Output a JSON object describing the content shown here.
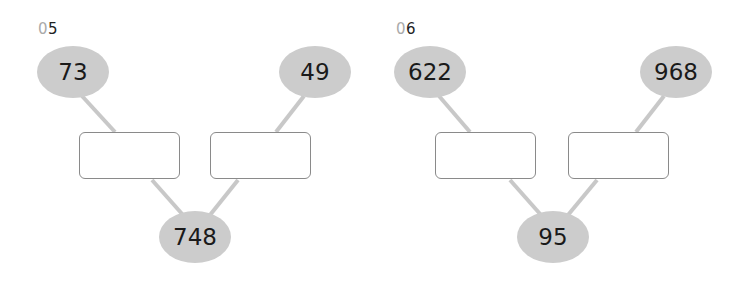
{
  "colors": {
    "oval_fill": "#cccccc",
    "line": "#c8c8c8",
    "box_border": "#8a8a8a",
    "number_prefix": "#aaaaaa"
  },
  "problems": [
    {
      "number_prefix": "0",
      "number_suffix": "5",
      "top_left": "73",
      "top_right": "49",
      "bottom": "748",
      "answer_boxes": [
        "",
        ""
      ]
    },
    {
      "number_prefix": "0",
      "number_suffix": "6",
      "top_left": "622",
      "top_right": "968",
      "bottom": "95",
      "answer_boxes": [
        "",
        ""
      ]
    }
  ]
}
